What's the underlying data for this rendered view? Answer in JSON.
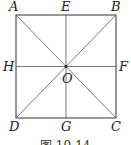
{
  "figure": {
    "caption": "图 10-14",
    "labels": {
      "A": "A",
      "B": "B",
      "C": "C",
      "D": "D",
      "E": "E",
      "F": "F",
      "G": "G",
      "H": "H",
      "O": "O"
    },
    "square": {
      "x1": 16,
      "y1": 15,
      "x2": 116,
      "y2": 118
    },
    "center": {
      "x": 66,
      "y": 66.5
    },
    "colors": {
      "line": "#333333",
      "background": "#ffffff"
    }
  }
}
